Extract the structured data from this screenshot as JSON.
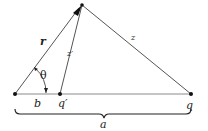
{
  "diagram": {
    "labels": {
      "r": "r",
      "theta": "θ",
      "z_prime": "z′",
      "z": "z",
      "b": "b",
      "q_prime": "q′",
      "q": "q",
      "a": "a"
    },
    "colors": {
      "line": "#555555",
      "point": "#111111",
      "text": "#222222"
    }
  }
}
